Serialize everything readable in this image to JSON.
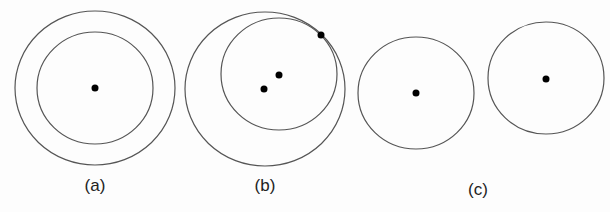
{
  "figure": {
    "stroke_color": "#555555",
    "dot_color": "#000000",
    "panels": [
      {
        "label": "(a)",
        "label_pos": [
          95,
          176
        ],
        "circles": [
          {
            "cx": 95,
            "cy": 88,
            "rx": 80,
            "ry": 77
          },
          {
            "cx": 95,
            "cy": 88,
            "rx": 58,
            "ry": 56
          }
        ],
        "dots": [
          [
            95,
            88
          ]
        ]
      },
      {
        "label": "(b)",
        "label_pos": [
          265,
          176
        ],
        "circles": [
          {
            "cx": 265,
            "cy": 89,
            "rx": 80,
            "ry": 77
          },
          {
            "cx": 279,
            "cy": 74,
            "rx": 58,
            "ry": 56
          }
        ],
        "dots": [
          [
            264,
            89
          ],
          [
            279,
            75
          ],
          [
            321,
            35
          ]
        ]
      },
      {
        "label": "(c)",
        "label_pos": [
          478,
          180
        ],
        "circles": [
          {
            "cx": 416,
            "cy": 93,
            "rx": 58,
            "ry": 56
          },
          {
            "cx": 546,
            "cy": 78,
            "rx": 58,
            "ry": 56
          }
        ],
        "dots": [
          [
            416,
            93
          ],
          [
            546,
            79
          ]
        ]
      }
    ]
  }
}
